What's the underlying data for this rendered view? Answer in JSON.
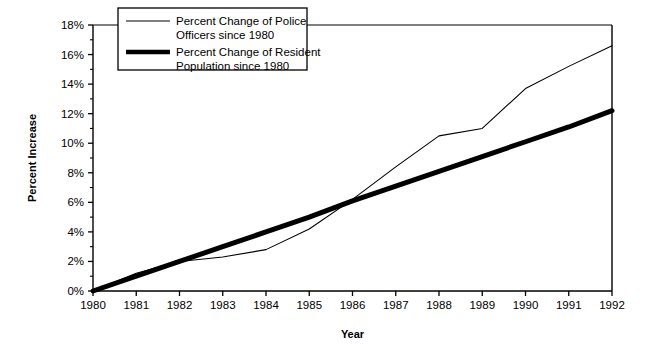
{
  "chart_data": {
    "type": "line",
    "title": "",
    "xlabel": "Year",
    "ylabel": "Percent Increase",
    "grid": false,
    "legend_position": "top-left-inside",
    "x": [
      1980,
      1981,
      1982,
      1983,
      1984,
      1985,
      1986,
      1987,
      1988,
      1989,
      1990,
      1991,
      1992
    ],
    "xlim": [
      1980,
      1992
    ],
    "ylim": [
      0,
      18
    ],
    "y_ticks": [
      0,
      2,
      4,
      6,
      8,
      10,
      12,
      14,
      16,
      18
    ],
    "y_tick_labels": [
      "0%",
      "2%",
      "4%",
      "6%",
      "8%",
      "10%",
      "12%",
      "14%",
      "16%",
      "18%"
    ],
    "y_minor_ticks": [
      1,
      3,
      5,
      7,
      9,
      11,
      13,
      15,
      17
    ],
    "x_tick_labels": [
      "1980",
      "1981",
      "1982",
      "1983",
      "1984",
      "1985",
      "1986",
      "1987",
      "1988",
      "1989",
      "1990",
      "1991",
      "1992"
    ],
    "series": [
      {
        "name": "Percent Change of Police Officers since 1980",
        "legend_label_line1": "Percent Change of Police",
        "legend_label_line2": "Officers since 1980",
        "style": "thin",
        "width": 1.1,
        "color": "#000000",
        "values": [
          0.0,
          1.2,
          2.0,
          2.3,
          2.8,
          4.2,
          6.2,
          8.4,
          10.5,
          11.0,
          13.7,
          15.2,
          16.6
        ]
      },
      {
        "name": "Percent Change of Resident Population since 1980",
        "legend_label_line1": "Percent Change of Resident",
        "legend_label_line2": "Population since 1980",
        "style": "thick",
        "width": 5.0,
        "color": "#000000",
        "values": [
          0.0,
          1.0,
          2.0,
          3.0,
          4.0,
          5.0,
          6.1,
          7.1,
          8.1,
          9.1,
          10.1,
          11.1,
          12.2
        ]
      }
    ]
  },
  "axes": {
    "y_title": "Percent Increase",
    "x_title": "Year"
  },
  "colors": {
    "axis": "#000000",
    "series_thin": "#000000",
    "series_thick": "#000000",
    "background": "#ffffff"
  }
}
